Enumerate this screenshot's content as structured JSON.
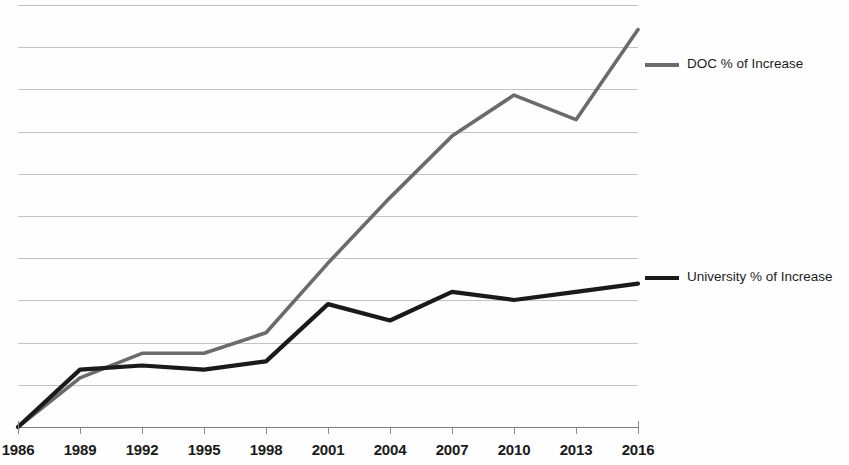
{
  "chart_data": {
    "type": "line",
    "title": "",
    "subtitle": "",
    "xlabel": "",
    "ylabel": "",
    "grid": true,
    "gridline_count": 11,
    "legend_position": "right",
    "x": [
      1986,
      1989,
      1992,
      1995,
      1998,
      2001,
      2004,
      2007,
      2010,
      2013,
      2016
    ],
    "categories": [
      "1986",
      "1989",
      "1992",
      "1995",
      "1998",
      "2001",
      "2004",
      "2007",
      "2010",
      "2013",
      "2016"
    ],
    "series": [
      {
        "name": "DOC % of Increase",
        "color": "#6b6b6b",
        "values": [
          0,
          12,
          18,
          18,
          23,
          40,
          56,
          71,
          81,
          75,
          97
        ]
      },
      {
        "name": "University % of Increase",
        "color": "#1a1a1a",
        "values": [
          0,
          14,
          15,
          14,
          16,
          30,
          26,
          33,
          31,
          33,
          35
        ]
      }
    ],
    "ylim": [
      0,
      103
    ],
    "y_tick_labels": []
  },
  "axis": {
    "x_tick_labels": [
      "1986",
      "1989",
      "1992",
      "1995",
      "1998",
      "2001",
      "2004",
      "2007",
      "2010",
      "2013",
      "2016"
    ]
  },
  "legend": {
    "items": [
      {
        "label": "DOC % of Increase",
        "color": "#6b6b6b"
      },
      {
        "label": "University % of Increase",
        "color": "#1a1a1a"
      }
    ]
  }
}
